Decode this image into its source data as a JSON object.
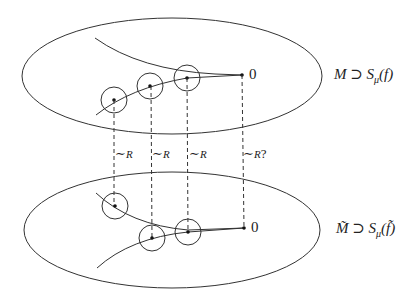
{
  "upper": {
    "label": "M ⊃ S",
    "sub": "μ",
    "arg": "(f)",
    "origin_label": "0"
  },
  "lower": {
    "label": "M̃ ⊃ S",
    "sub": "μ",
    "arg": "(f̃)",
    "origin_label": "0"
  },
  "relations": [
    {
      "label": "∼",
      "sub": "R"
    },
    {
      "label": "∼",
      "sub": "R"
    },
    {
      "label": "∼",
      "sub": "R"
    },
    {
      "label": "∼",
      "sub": "R",
      "suffix": "?"
    }
  ],
  "colors": {
    "stroke": "#333333",
    "background": "#ffffff"
  }
}
